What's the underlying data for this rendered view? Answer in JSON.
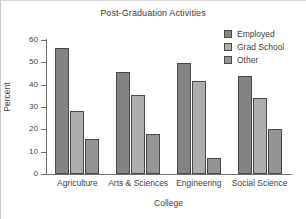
{
  "chart_data": {
    "type": "bar",
    "title": "Post-Graduation Activities",
    "xlabel": "College",
    "ylabel": "Percent",
    "categories": [
      "Agriculture",
      "Arts & Sciences",
      "Engineering",
      "Social Science"
    ],
    "series": [
      {
        "name": "Employed",
        "values": [
          56.5,
          45.5,
          49.5,
          44.0
        ],
        "color": "#838383"
      },
      {
        "name": "Grad School",
        "values": [
          28.0,
          35.5,
          41.5,
          34.0
        ],
        "color": "#adadad"
      },
      {
        "name": "Other",
        "values": [
          15.5,
          18.0,
          7.0,
          20.0
        ],
        "color": "#949494"
      }
    ],
    "ylim": [
      0,
      60
    ],
    "ytick_values": [
      0,
      10,
      20,
      30,
      40,
      50,
      60
    ],
    "ytick_labels": [
      "0",
      "10",
      "20",
      "30",
      "40",
      "50",
      "60"
    ],
    "grid": false,
    "legend_position": "top-right"
  },
  "legend": {
    "entries": [
      {
        "label": "Employed"
      },
      {
        "label": "Grad School"
      },
      {
        "label": "Other"
      }
    ]
  }
}
